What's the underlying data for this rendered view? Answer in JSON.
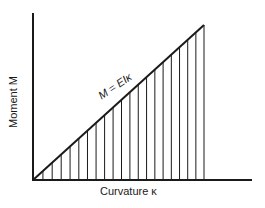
{
  "diagram": {
    "y_axis_label": "Moment M",
    "x_axis_label": "Curvature κ",
    "equation": "M = EIκ",
    "hatch_count": 20,
    "colors": {
      "ink": "#1a1a1a",
      "background": "#ffffff"
    }
  },
  "chart_data": {
    "type": "line",
    "title": "",
    "xlabel": "Curvature κ",
    "ylabel": "Moment M",
    "series": [
      {
        "name": "M = EIκ",
        "x": [
          0,
          1
        ],
        "y": [
          0,
          1
        ]
      }
    ],
    "annotations": [
      "M = EIκ"
    ],
    "grid": false,
    "fill": "vertical hatching under line"
  }
}
